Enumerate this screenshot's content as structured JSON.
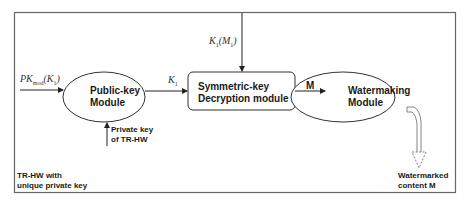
{
  "diagram": {
    "container": {
      "label_line1": "TR-HW with",
      "label_line2": "unique private key"
    },
    "nodes": {
      "public_key_module": {
        "line1": "Public-key",
        "line2": "Module",
        "shape": "ellipse"
      },
      "symmetric_key_module": {
        "line1": "Symmetric-key",
        "line2": "Decryption module",
        "shape": "rounded-rectangle"
      },
      "watermarking_module": {
        "line1": "Watermaking",
        "line2": "Module",
        "shape": "ellipse"
      }
    },
    "edges": {
      "input_pk": {
        "label_main": "PK",
        "label_sub": "mod",
        "label_arg": "(K",
        "label_arg_sub": "1",
        "label_close": ")"
      },
      "private_key": {
        "line1": "Private key",
        "line2": "of TR-HW"
      },
      "k1": {
        "label_main": "K",
        "label_sub": "1"
      },
      "k1_m1": {
        "label_main": "K",
        "label_sub": "1",
        "label_arg": "(M",
        "label_arg_sub": "1",
        "label_close": ")"
      },
      "m": {
        "label": "M"
      },
      "output": {
        "line1": "Watermarked",
        "line2": "content M"
      }
    },
    "colors": {
      "stroke": "#333333",
      "frame": "#555555",
      "background": "#ffffff"
    }
  }
}
